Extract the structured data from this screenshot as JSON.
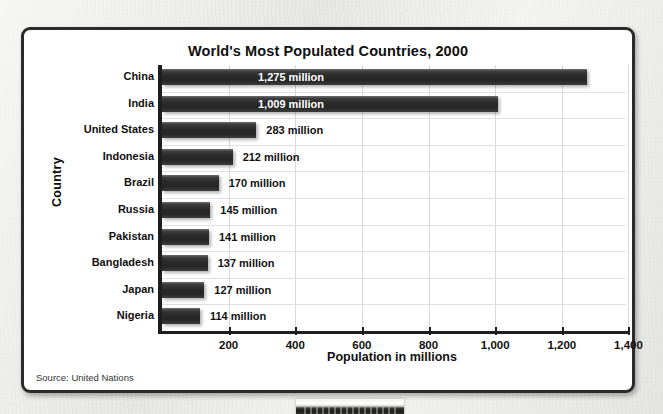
{
  "card": {
    "title": "World's Most Populated Countries, 2000",
    "source_note": "Source: United Nations"
  },
  "chart_data": {
    "type": "bar",
    "orientation": "horizontal",
    "title": "World's Most Populated Countries, 2000",
    "xlabel": "Population in millions",
    "ylabel": "Country",
    "categories": [
      "China",
      "India",
      "United States",
      "Indonesia",
      "Brazil",
      "Russia",
      "Pakistan",
      "Bangladesh",
      "Japan",
      "Nigeria"
    ],
    "values": [
      1275,
      1009,
      283,
      212,
      170,
      145,
      141,
      137,
      127,
      114
    ],
    "data_labels": [
      "1,275 million",
      "1,009 million",
      "283 million",
      "212 million",
      "170 million",
      "145 million",
      "141 million",
      "137 million",
      "127 million",
      "114 million"
    ],
    "label_placement": [
      "inside",
      "inside",
      "outside",
      "outside",
      "outside",
      "outside",
      "outside",
      "outside",
      "outside",
      "outside"
    ],
    "xlim": [
      0,
      1400
    ],
    "xticks": [
      200,
      400,
      600,
      800,
      1000,
      1200,
      1400
    ],
    "xtick_labels": [
      "200",
      "400",
      "600",
      "800",
      "1,000",
      "1,200",
      "1,400"
    ],
    "grid": true,
    "legend": false,
    "bar_color": "#2a2a2a",
    "inside_label_color": "#ffffff",
    "outside_label_color": "#111111",
    "axis_color": "#1e1e1e",
    "background": "#ffffff"
  }
}
